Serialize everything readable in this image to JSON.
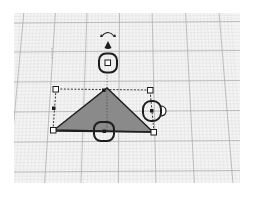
{
  "app": {
    "view": "3D workplane editor"
  },
  "workplane": {
    "background_color": "#f4f4f4",
    "minor_grid_color": "#dcdcdc",
    "major_grid_color": "#a8a8a8"
  },
  "shape": {
    "type": "triangular-prism",
    "fill_color": "#8a8a8a",
    "outline_color": "#1e1e1e",
    "selected": true
  },
  "gizmo": {
    "handle_color": "#1e1e1e",
    "handle_fill": "#ffffff",
    "handles": [
      "corner-handle-top-left",
      "corner-handle-top-right",
      "corner-handle-bottom-left",
      "corner-handle-bottom-right",
      "side-handle-left",
      "top-handle",
      "height-handle",
      "lift-handle",
      "rotate-handle-top",
      "rotate-handle-right",
      "rotate-handle-front"
    ]
  }
}
